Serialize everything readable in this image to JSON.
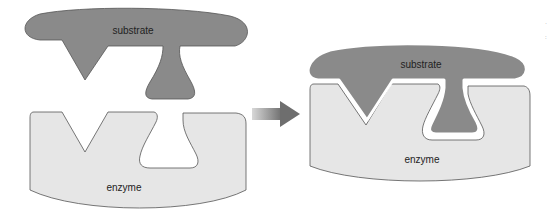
{
  "diagram": {
    "left_panel": {
      "substrate_label": "substrate",
      "enzyme_label": "enzyme"
    },
    "right_panel": {
      "substrate_label": "substrate",
      "enzyme_label": "enzyme"
    },
    "colors": {
      "substrate": "#8a8a8a",
      "enzyme": "#e6e6e6",
      "outline": "#555555",
      "arrow": "#7a7a7a"
    }
  }
}
